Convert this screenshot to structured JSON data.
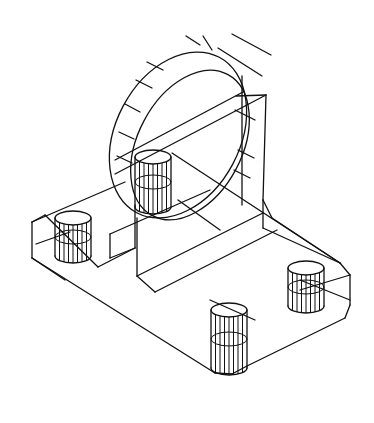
{
  "figure": {
    "type": "isometric-wireframe",
    "line_color": "#111111",
    "background": "#ffffff",
    "width": 374,
    "height": 423
  },
  "geometry": {
    "lines": [
      [
        32,
        222,
        125,
        182
      ],
      [
        32,
        222,
        32,
        258
      ],
      [
        32,
        258,
        65,
        280
      ],
      [
        32,
        222,
        45,
        215
      ],
      [
        36,
        244,
        70,
        232
      ],
      [
        32,
        258,
        215,
        373
      ],
      [
        215,
        373,
        232,
        374
      ],
      [
        232,
        374,
        247,
        366
      ],
      [
        247,
        366,
        345,
        318
      ],
      [
        345,
        318,
        350,
        305
      ],
      [
        350,
        305,
        350,
        275
      ],
      [
        350,
        275,
        340,
        263
      ],
      [
        340,
        263,
        263,
        228
      ],
      [
        263,
        228,
        263,
        200
      ],
      [
        263,
        200,
        272,
        218
      ],
      [
        272,
        218,
        340,
        263
      ],
      [
        45,
        215,
        98,
        267
      ],
      [
        98,
        267,
        135,
        248
      ],
      [
        110,
        234,
        210,
        190
      ],
      [
        110,
        234,
        110,
        258
      ],
      [
        110,
        258,
        135,
        248
      ],
      [
        135,
        248,
        135,
        205
      ],
      [
        137,
        276,
        155,
        292
      ],
      [
        137,
        276,
        137,
        218
      ],
      [
        155,
        292,
        277,
        230
      ],
      [
        137,
        276,
        263,
        213
      ],
      [
        172,
        153,
        340,
        263
      ],
      [
        115,
        160,
        243,
        92
      ],
      [
        115,
        174,
        266,
        95
      ],
      [
        218,
        48,
        262,
        76
      ],
      [
        232,
        34,
        271,
        55
      ],
      [
        236,
        96,
        266,
        95
      ],
      [
        235,
        110,
        255,
        120
      ],
      [
        242,
        76,
        242,
        205
      ],
      [
        266,
        95,
        263,
        200
      ],
      [
        300,
        290,
        350,
        275
      ],
      [
        300,
        280,
        350,
        300
      ],
      [
        210,
        300,
        255,
        320
      ],
      [
        178,
        200,
        220,
        230
      ]
    ],
    "ellipses": [
      {
        "cx": 178,
        "cy": 135,
        "rx": 62,
        "ry": 88,
        "rot": 28
      },
      {
        "cx": 190,
        "cy": 145,
        "rx": 52,
        "ry": 80,
        "rot": 28
      }
    ],
    "spokes": [
      [
        147,
        62,
        163,
        70
      ],
      [
        136,
        80,
        152,
        88
      ],
      [
        125,
        104,
        140,
        112
      ],
      [
        119,
        132,
        134,
        139
      ],
      [
        117,
        156,
        132,
        163
      ],
      [
        186,
        36,
        200,
        45
      ],
      [
        203,
        36,
        212,
        50
      ],
      [
        238,
        150,
        254,
        158
      ],
      [
        234,
        170,
        250,
        178
      ]
    ],
    "cylinders": [
      {
        "name": "hole-left",
        "cx": 73,
        "top": 218,
        "bottom": 256,
        "rx": 18,
        "ry": 7
      },
      {
        "name": "hole-center",
        "cx": 153,
        "top": 157,
        "bottom": 207,
        "rx": 18,
        "ry": 7
      },
      {
        "name": "hole-right",
        "cx": 306,
        "top": 268,
        "bottom": 306,
        "rx": 18,
        "ry": 7
      },
      {
        "name": "hole-front",
        "cx": 229,
        "top": 310,
        "bottom": 368,
        "rx": 18,
        "ry": 7
      }
    ],
    "hatch_count": 8
  }
}
